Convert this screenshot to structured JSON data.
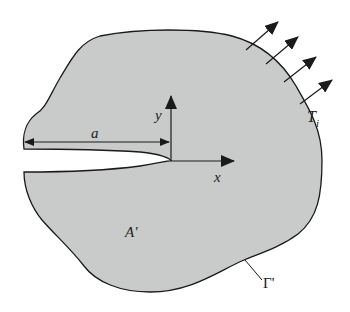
{
  "diagram": {
    "colors": {
      "fill": "#c9caca",
      "stroke": "#1a1a1a",
      "background": "#ffffff"
    },
    "labels": {
      "crack_length": "a",
      "y_axis": "y",
      "x_axis": "x",
      "traction": "T",
      "traction_subscript": "i",
      "area": "A'",
      "contour": "Γ'"
    },
    "traction_arrow_count": 4
  }
}
